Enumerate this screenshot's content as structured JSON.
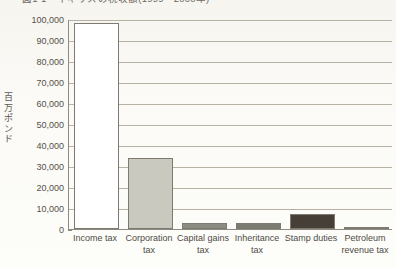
{
  "chart_data": {
    "type": "bar",
    "title": "図1-1　イギリスの税収額(1999－2000年)",
    "categories": [
      "Income tax",
      "Corporation tax",
      "Capital gains tax",
      "Inheritance tax",
      "Stamp duties",
      "Petroleum revenue tax"
    ],
    "values": [
      98000,
      34000,
      3000,
      3000,
      7000,
      1000
    ],
    "bar_colors": [
      "#ffffff",
      "#c9c9bf",
      "#8d8c83",
      "#7d7c73",
      "#453f38",
      "#2f2b26"
    ],
    "xlabel": "",
    "ylabel": "百万ポンド",
    "ylim": [
      0,
      100000
    ],
    "ytick_values": [
      0,
      10000,
      20000,
      30000,
      40000,
      50000,
      60000,
      70000,
      80000,
      90000,
      100000
    ],
    "ytick_labels": [
      "0",
      "10,000",
      "20,000",
      "30,000",
      "40,000",
      "50,000",
      "60,000",
      "70,000",
      "80,000",
      "90,000",
      "100,000"
    ],
    "grid": true,
    "legend": false
  },
  "axis": {
    "y_title_chars": [
      "百",
      "万",
      "ポ",
      "ン",
      "ド"
    ]
  },
  "colors": {
    "grid": "#b8b2a4",
    "axis": "#8e8a80",
    "text": "#4f4b44",
    "background": "#fbfaf6"
  }
}
